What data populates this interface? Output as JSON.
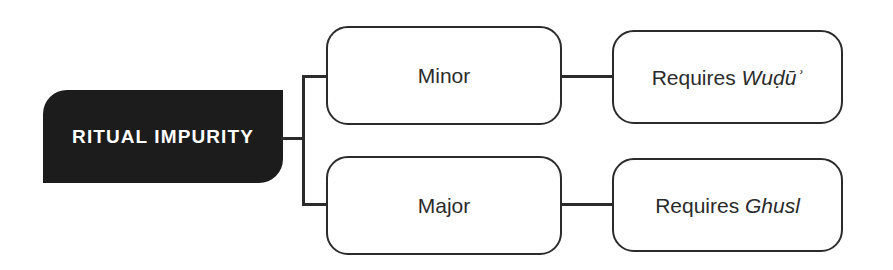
{
  "diagram": {
    "type": "hierarchy-tree",
    "background_color": "#ffffff",
    "accent_color": "#1c1c1c",
    "line_color": "#2b2b2b",
    "root": {
      "label": "RITUAL IMPURITY",
      "text_color": "#ffffff",
      "fill_color": "#1c1c1c"
    },
    "branches": [
      {
        "category": {
          "label": "Minor"
        },
        "requirement": {
          "prefix": "Requires ",
          "term": "Wuḍūʾ",
          "full_label": "Requires Wuḍūʾ"
        }
      },
      {
        "category": {
          "label": "Major"
        },
        "requirement": {
          "prefix": "Requires ",
          "term": "Ghusl",
          "full_label": "Requires Ghusl"
        }
      }
    ]
  }
}
